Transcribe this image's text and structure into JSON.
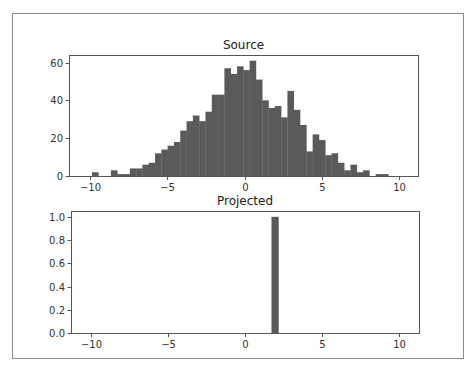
{
  "chart_data": [
    {
      "type": "bar",
      "subtype": "histogram",
      "title": "Source",
      "xlabel": "",
      "ylabel": "",
      "xlim": [
        -11.36,
        11.23
      ],
      "ylim": [
        0,
        64
      ],
      "xticks": [
        -10,
        -5,
        0,
        5,
        10
      ],
      "xtick_labels": [
        "−10",
        "−5",
        "0",
        "5",
        "10"
      ],
      "yticks": [
        0,
        20,
        40,
        60
      ],
      "ytick_labels": [
        "0",
        "20",
        "40",
        "60"
      ],
      "grid": false,
      "legend": null,
      "bin_start": -9.87,
      "bin_width": 0.408,
      "values": [
        2,
        0,
        0,
        3,
        1,
        1,
        4,
        4,
        6,
        7,
        12,
        14,
        16,
        18,
        24,
        29,
        32,
        29,
        34,
        43,
        43,
        57,
        54,
        58,
        56,
        61,
        51,
        40,
        36,
        37,
        31,
        45,
        35,
        27,
        13,
        22,
        19,
        11,
        12,
        7,
        3,
        6,
        2,
        3,
        0,
        1,
        1,
        0
      ],
      "color": "#5a5a5a"
    },
    {
      "type": "bar",
      "subtype": "histogram",
      "title": "Projected",
      "xlabel": "",
      "ylabel": "",
      "xlim": [
        -11.3,
        11.3
      ],
      "ylim": [
        0,
        1.05
      ],
      "xticks": [
        -10,
        -5,
        0,
        5,
        10
      ],
      "xtick_labels": [
        "−10",
        "−5",
        "0",
        "5",
        "10"
      ],
      "yticks": [
        0.0,
        0.2,
        0.4,
        0.6,
        0.8,
        1.0
      ],
      "ytick_labels": [
        "0.0",
        "0.2",
        "0.4",
        "0.6",
        "0.8",
        "1.0"
      ],
      "grid": false,
      "legend": null,
      "bin_start": 1.72,
      "bin_width": 0.45,
      "values": [
        1.0
      ],
      "color": "#5a5a5a"
    }
  ],
  "layout": {
    "figure_frame": {
      "x": 12,
      "y": 13,
      "w": 451,
      "h": 345
    },
    "axes": [
      {
        "x": 69,
        "y": 55,
        "w": 349,
        "h": 121
      },
      {
        "x": 71,
        "y": 211,
        "w": 348,
        "h": 122
      }
    ]
  }
}
